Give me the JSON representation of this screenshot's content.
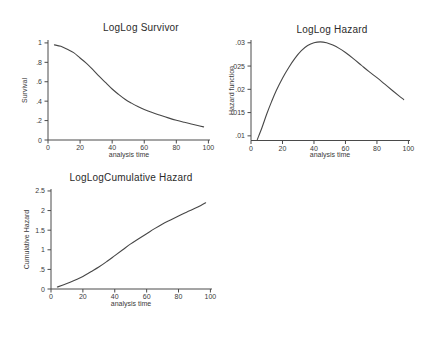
{
  "window": {
    "background": "#ffffff"
  },
  "colors": {
    "axis": "#4a4a4a",
    "line": "#474747",
    "text": "#3a3a3a",
    "title": "#2b2b2b"
  },
  "chart_data": [
    {
      "type": "line",
      "title": "LogLog Survivor",
      "xlabel": "analysis time",
      "ylabel": "Survival",
      "grid": false,
      "legend": "none",
      "xlim": [
        0,
        101
      ],
      "ylim": [
        0,
        1.03
      ],
      "xticks": [
        0,
        20,
        40,
        60,
        80,
        100
      ],
      "xtick_labels": [
        "0",
        "20",
        "40",
        "60",
        "80",
        "100"
      ],
      "yticks": [
        0,
        0.2,
        0.4,
        0.6,
        0.8,
        1
      ],
      "ytick_labels": [
        "0",
        ".2",
        ".4",
        ".6",
        ".8",
        "1"
      ],
      "x": [
        4,
        8,
        12,
        16,
        20,
        24,
        28,
        32,
        36,
        40,
        44,
        48,
        52,
        56,
        60,
        65,
        70,
        75,
        80,
        85,
        90,
        94,
        97
      ],
      "y": [
        0.98,
        0.965,
        0.935,
        0.9,
        0.845,
        0.79,
        0.725,
        0.655,
        0.59,
        0.525,
        0.47,
        0.42,
        0.38,
        0.345,
        0.315,
        0.283,
        0.255,
        0.228,
        0.203,
        0.182,
        0.163,
        0.147,
        0.135
      ]
    },
    {
      "type": "line",
      "title": "LogLog Hazard",
      "xlabel": "analysis time",
      "ylabel": "Hazard function",
      "grid": false,
      "legend": "none",
      "xlim": [
        0,
        101
      ],
      "ylim": [
        0.009,
        0.0306
      ],
      "xticks": [
        0,
        20,
        40,
        60,
        80,
        100
      ],
      "xtick_labels": [
        "0",
        "20",
        "40",
        "60",
        "80",
        "100"
      ],
      "yticks": [
        0.01,
        0.015,
        0.02,
        0.025,
        0.03
      ],
      "ytick_labels": [
        ".01",
        ".015",
        ".02",
        ".025",
        ".03"
      ],
      "x": [
        4,
        7,
        10,
        13,
        16,
        20,
        24,
        28,
        32,
        36,
        40,
        44,
        48,
        52,
        56,
        60,
        65,
        70,
        75,
        80,
        85,
        90,
        94,
        97
      ],
      "y": [
        0.0092,
        0.0118,
        0.0147,
        0.0173,
        0.0197,
        0.0224,
        0.0247,
        0.0267,
        0.0283,
        0.0294,
        0.03,
        0.0302,
        0.03,
        0.0295,
        0.0288,
        0.0279,
        0.0266,
        0.0252,
        0.0238,
        0.0225,
        0.0211,
        0.0197,
        0.0186,
        0.0178
      ]
    },
    {
      "type": "line",
      "title": "LogLogCumulative Hazard",
      "xlabel": "analysis time",
      "ylabel": "Cumulative Hazard",
      "grid": false,
      "legend": "none",
      "xlim": [
        0,
        101
      ],
      "ylim": [
        0,
        2.55
      ],
      "xticks": [
        0,
        20,
        40,
        60,
        80,
        100
      ],
      "xtick_labels": [
        "0",
        "20",
        "40",
        "60",
        "80",
        "100"
      ],
      "yticks": [
        0,
        0.5,
        1,
        1.5,
        2,
        2.5
      ],
      "ytick_labels": [
        "0",
        ".5",
        "1",
        "1.5",
        "2",
        "2.5"
      ],
      "x": [
        4,
        8,
        12,
        16,
        20,
        25,
        30,
        35,
        40,
        45,
        50,
        55,
        60,
        65,
        70,
        75,
        80,
        85,
        90,
        94,
        97
      ],
      "y": [
        0.05,
        0.11,
        0.175,
        0.245,
        0.32,
        0.44,
        0.56,
        0.7,
        0.85,
        1.0,
        1.15,
        1.28,
        1.41,
        1.54,
        1.66,
        1.76,
        1.86,
        1.96,
        2.05,
        2.13,
        2.2
      ]
    }
  ]
}
